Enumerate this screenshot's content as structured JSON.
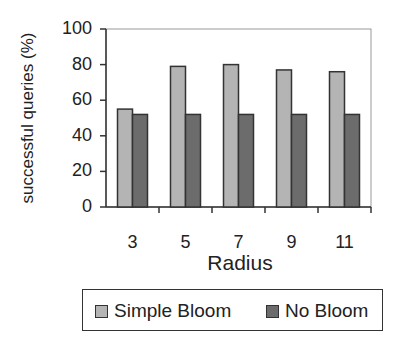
{
  "chart_data": {
    "type": "bar",
    "title": "",
    "xlabel": "Radius",
    "ylabel": "successful queries (%)",
    "categories": [
      "3",
      "5",
      "7",
      "9",
      "11"
    ],
    "series": [
      {
        "name": "Simple Bloom",
        "values": [
          55,
          79,
          80,
          77,
          76
        ],
        "color": "#b4b4b4"
      },
      {
        "name": "No Bloom",
        "values": [
          52,
          52,
          52,
          52,
          52
        ],
        "color": "#6c6c6c"
      }
    ],
    "ylim": [
      0,
      100
    ],
    "yticks": [
      "0",
      "20",
      "40",
      "60",
      "80",
      "100"
    ],
    "grid": false,
    "legend_position": "bottom"
  }
}
